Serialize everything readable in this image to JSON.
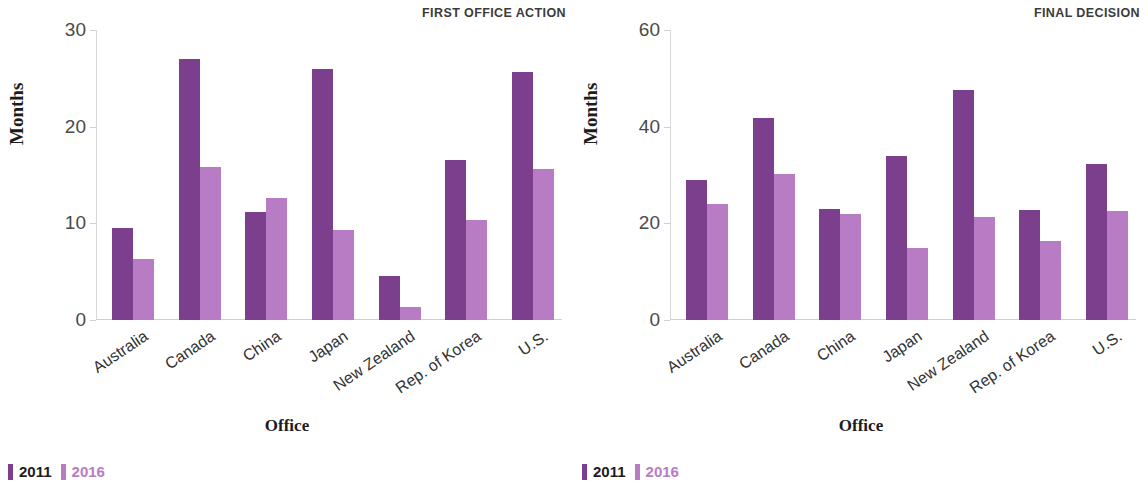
{
  "colors": {
    "series_2011": "#7c3f8e",
    "series_2016": "#b87cc4",
    "axis": "#d5d5d5",
    "tick_text": "#4a4a4a",
    "title_text": "#3b3b3b",
    "label_text": "#1c1c1c"
  },
  "legend": {
    "items": [
      {
        "label": "2011",
        "color": "#7c3f8e"
      },
      {
        "label": "2016",
        "color": "#b87cc4"
      }
    ]
  },
  "chart_data": [
    {
      "type": "bar",
      "title": "FIRST OFFICE ACTION",
      "xlabel": "Office",
      "ylabel": "Months",
      "ylim": [
        0,
        30
      ],
      "yticks": [
        0,
        10,
        20,
        30
      ],
      "grid": false,
      "legend_position": "bottom-left",
      "categories": [
        "Australia",
        "Canada",
        "China",
        "Japan",
        "New Zealand",
        "Rep. of Korea",
        "U.S."
      ],
      "series": [
        {
          "name": "2011",
          "color": "#7c3f8e",
          "values": [
            9.5,
            27.0,
            11.2,
            26.0,
            4.6,
            16.6,
            25.7
          ]
        },
        {
          "name": "2016",
          "color": "#b87cc4",
          "values": [
            6.3,
            15.8,
            12.6,
            9.3,
            1.3,
            10.3,
            15.6
          ]
        }
      ]
    },
    {
      "type": "bar",
      "title": "FINAL DECISION",
      "xlabel": "Office",
      "ylabel": "Months",
      "ylim": [
        0,
        60
      ],
      "yticks": [
        0,
        20,
        40,
        60
      ],
      "grid": false,
      "legend_position": "bottom-left",
      "categories": [
        "Australia",
        "Canada",
        "China",
        "Japan",
        "New Zealand",
        "Rep. of Korea",
        "U.S."
      ],
      "series": [
        {
          "name": "2011",
          "color": "#7c3f8e",
          "values": [
            29.0,
            41.8,
            23.0,
            34.0,
            47.5,
            22.7,
            32.2
          ]
        },
        {
          "name": "2016",
          "color": "#b87cc4",
          "values": [
            24.0,
            30.2,
            22.0,
            15.0,
            21.3,
            16.3,
            22.5
          ]
        }
      ]
    }
  ]
}
